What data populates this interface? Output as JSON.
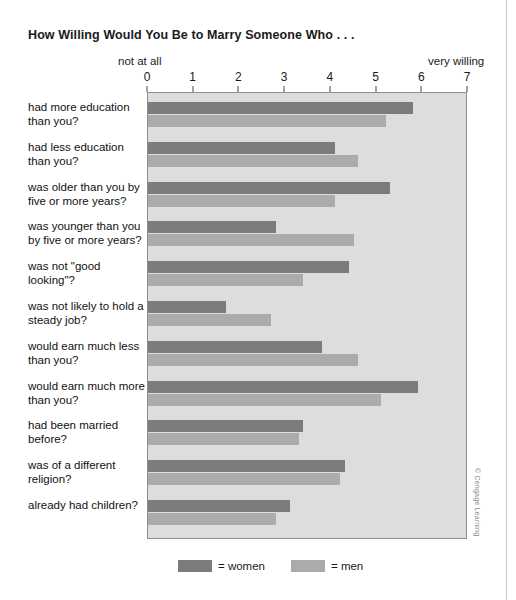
{
  "title": "How Willing Would You Be to Marry Someone Who . . .",
  "axis": {
    "low_anchor": "not at all",
    "high_anchor": "very willing",
    "ticks": [
      "0",
      "1",
      "2",
      "3",
      "4",
      "5",
      "6",
      "7"
    ]
  },
  "legend": {
    "women_label": "= women",
    "men_label": "= men"
  },
  "credit": "© Cengage Learning",
  "colors": {
    "women": "#7c7c7c",
    "men": "#ababab",
    "plot_background": "#dddddd",
    "plot_border": "#8e8e8e"
  },
  "chart_data": {
    "type": "bar",
    "orientation": "horizontal",
    "title": "How Willing Would You Be to Marry Someone Who . . .",
    "xlabel": "",
    "ylabel": "",
    "xlim": [
      0,
      7
    ],
    "xticks": [
      0,
      1,
      2,
      3,
      4,
      5,
      6,
      7
    ],
    "x_low_anchor": "not at all",
    "x_high_anchor": "very willing",
    "grid": false,
    "legend_position": "bottom",
    "categories": [
      "had more education than you?",
      "had less education than you?",
      "was older than you by five or more years?",
      "was younger than you by five or more years?",
      "was not \"good looking\"?",
      "was not likely to hold a steady job?",
      "would earn much less than you?",
      "would earn much more than you?",
      "had been married before?",
      "was of a different religion?",
      "already had children?"
    ],
    "series": [
      {
        "name": "women",
        "color": "#7c7c7c",
        "values": [
          5.8,
          4.1,
          5.3,
          2.8,
          4.4,
          1.7,
          3.8,
          5.9,
          3.4,
          4.3,
          3.1
        ]
      },
      {
        "name": "men",
        "color": "#ababab",
        "values": [
          5.2,
          4.6,
          4.1,
          4.5,
          3.4,
          2.7,
          4.6,
          5.1,
          3.3,
          4.2,
          2.8
        ]
      }
    ]
  }
}
